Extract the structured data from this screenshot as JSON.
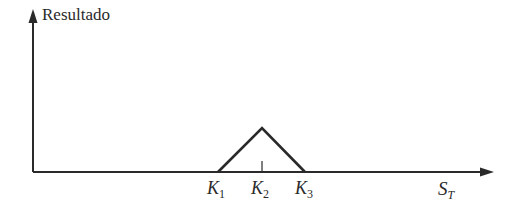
{
  "diagram": {
    "y_axis_label": "Resultado",
    "x_axis_label": {
      "base": "S",
      "sub": "T"
    },
    "strikes": [
      {
        "base": "K",
        "sub": "1"
      },
      {
        "base": "K",
        "sub": "2"
      },
      {
        "base": "K",
        "sub": "3"
      }
    ],
    "payoff_shape": "butterfly-spread-triangle",
    "line_color": "#2a2a2a"
  }
}
